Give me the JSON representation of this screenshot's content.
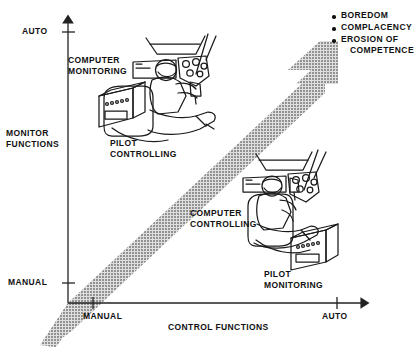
{
  "figure": {
    "type": "conceptual-diagram"
  },
  "axes": {
    "y": {
      "name": "MONITOR FUNCTIONS",
      "label_lines": [
        "MONITOR",
        "FUNCTIONS"
      ],
      "ticks": [
        {
          "label": "AUTO",
          "position": "top"
        },
        {
          "label": "MANUAL",
          "position": "bottom"
        }
      ]
    },
    "x": {
      "name": "CONTROL FUNCTIONS",
      "label_lines": [
        "CONTROL FUNCTIONS"
      ],
      "ticks": [
        {
          "label": "MANUAL",
          "position": "left"
        },
        {
          "label": "AUTO",
          "position": "right"
        }
      ]
    }
  },
  "band": {
    "name": "automation-trade-off-band",
    "fill": "#9a9a9a",
    "direction": "diagonal-up-right",
    "arrowhead": true
  },
  "annotations": [
    {
      "id": "upper-left",
      "caption_top_lines": [
        "COMPUTER",
        "MONITORING"
      ],
      "caption_bottom_lines": [
        "PILOT",
        "CONTROLLING"
      ]
    },
    {
      "id": "lower-right",
      "caption_top_lines": [
        "COMPUTER",
        "CONTROLLING"
      ],
      "caption_bottom_lines": [
        "PILOT",
        "MONITORING"
      ]
    }
  ],
  "legend": {
    "name": "automation-effects-legend",
    "items": [
      {
        "lines": [
          "BOREDOM"
        ]
      },
      {
        "lines": [
          "COMPLACENCY"
        ]
      },
      {
        "lines": [
          "EROSION OF",
          "COMPETENCE"
        ]
      }
    ],
    "flat": [
      "BOREDOM",
      "COMPLACENCY",
      "EROSION OF",
      "COMPETENCE"
    ]
  },
  "colors": {
    "ink": "#111111",
    "band": "#9a9a9a",
    "background": "#ffffff"
  }
}
